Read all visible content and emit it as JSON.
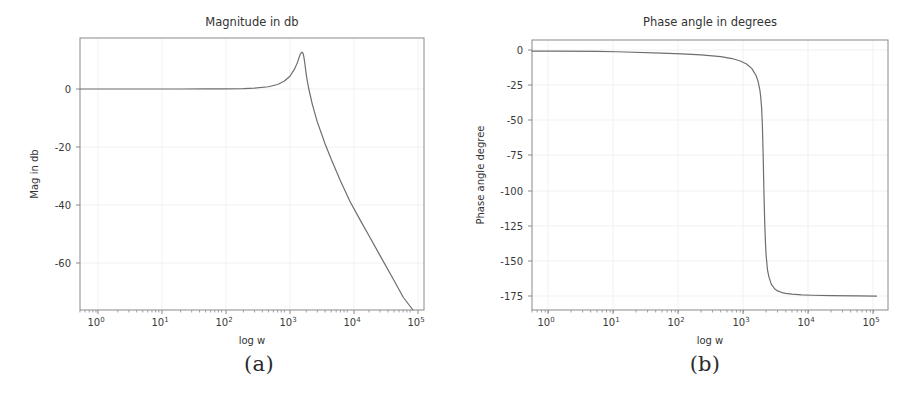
{
  "figure": {
    "background": "#ffffff",
    "curve_color": "#6e6e6e",
    "grid_color": "#ededf2",
    "axis_color": "#8a8a8a"
  },
  "panels": [
    {
      "caption": "(a)",
      "chart_data": {
        "type": "line",
        "title": "Magnitude in db",
        "xlabel": "log w",
        "ylabel": "Mag in db",
        "xscale": "log",
        "xlim": [
          0.5,
          150000
        ],
        "ylim": [
          -78,
          18
        ],
        "grid": true,
        "legend": "none",
        "xticks": [
          "10^0",
          "10^1",
          "10^2",
          "10^3",
          "10^4",
          "10^5"
        ],
        "xtick_values": [
          1,
          10,
          100,
          1000,
          10000,
          100000
        ],
        "yticks": [
          "0",
          "-20",
          "-40",
          "-60"
        ],
        "ytick_values": [
          0,
          -20,
          -40,
          -60
        ],
        "series": [
          {
            "name": "magnitude",
            "x": [
              0.5,
              1,
              2,
              5,
              10,
              20,
              50,
              100,
              200,
              300,
              500,
              700,
              900,
              1100,
              1300,
              1450,
              1600,
              1700,
              1780,
              1830,
              1870,
              1900,
              1950,
              2050,
              2200,
              2500,
              3000,
              4000,
              5000,
              7000,
              10000,
              15000,
              20000,
              30000,
              50000,
              70000,
              100000
            ],
            "y": [
              0.0,
              0.0,
              0.0,
              0.0,
              0.0,
              0.0,
              0.01,
              0.03,
              0.12,
              0.28,
              0.8,
              1.6,
              2.8,
              4.5,
              7.0,
              9.4,
              12.2,
              13.0,
              12.6,
              11.4,
              10.1,
              9.0,
              7.0,
              3.6,
              0.0,
              -5.4,
              -11.6,
              -19.4,
              -24.8,
              -32.4,
              -39.8,
              -46.9,
              -51.8,
              -58.8,
              -67.6,
              -73.5,
              -80.4
            ]
          }
        ],
        "annotations": {
          "peak_frequency": 1700,
          "peak_magnitude_db": 13,
          "rolloff_db_per_decade": -40
        }
      }
    },
    {
      "caption": "(b)",
      "chart_data": {
        "type": "line",
        "title": "Phase angle in degrees",
        "xlabel": "log w",
        "ylabel": "Phase angle degree",
        "xscale": "log",
        "xlim": [
          0.5,
          150000
        ],
        "ylim": [
          -190,
          8
        ],
        "grid": true,
        "legend": "none",
        "xticks": [
          "10^0",
          "10^1",
          "10^2",
          "10^3",
          "10^4",
          "10^5"
        ],
        "xtick_values": [
          1,
          10,
          100,
          1000,
          10000,
          100000
        ],
        "yticks": [
          "0",
          "-25",
          "-50",
          "-75",
          "-100",
          "-125",
          "-150",
          "-175"
        ],
        "ytick_values": [
          0,
          -25,
          -50,
          -75,
          -100,
          -125,
          -150,
          -175
        ],
        "series": [
          {
            "name": "phase",
            "x": [
              0.5,
              1,
              5,
              10,
              50,
              100,
              200,
              400,
              600,
              800,
              1000,
              1200,
              1400,
              1500,
              1600,
              1650,
              1700,
              1750,
              1800,
              1850,
              1900,
              1950,
              2000,
              2100,
              2200,
              2400,
              2700,
              3000,
              3500,
              4000,
              5000,
              7000,
              10000,
              20000,
              50000,
              100000
            ],
            "y": [
              -0.1,
              -0.1,
              -0.3,
              -0.6,
              -1.6,
              -2.2,
              -2.9,
              -4.2,
              -5.6,
              -7.4,
              -9.6,
              -12.8,
              -18.0,
              -22.2,
              -28.5,
              -33.5,
              -41.0,
              -54.0,
              -76.0,
              -103.0,
              -125.0,
              -140.0,
              -150.0,
              -160.5,
              -165.5,
              -171.0,
              -174.4,
              -176.0,
              -177.2,
              -177.8,
              -178.4,
              -178.9,
              -179.2,
              -179.5,
              -179.7,
              -179.8
            ]
          }
        ],
        "annotations": {
          "transition_frequency": 1800,
          "low_freq_asymptote_deg": 0,
          "high_freq_asymptote_deg": -180
        }
      }
    }
  ]
}
